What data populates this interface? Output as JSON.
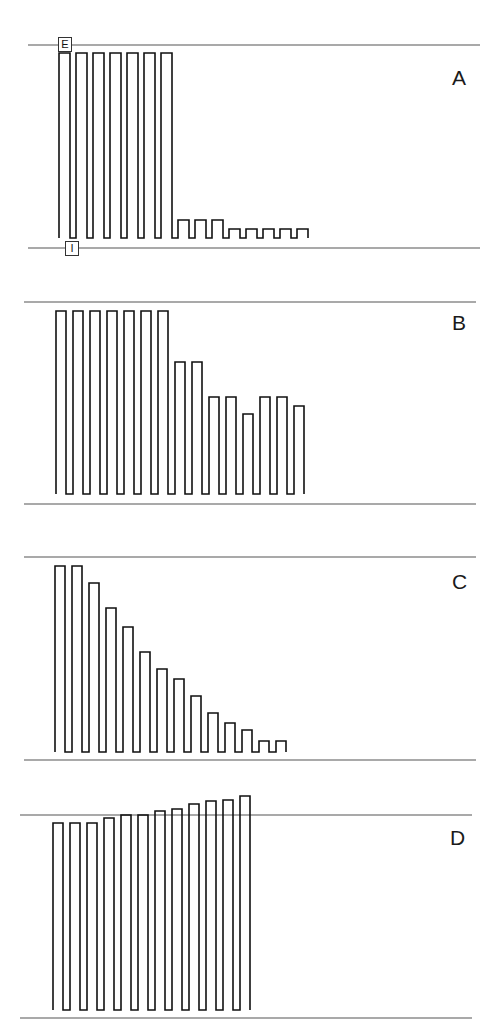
{
  "figure": {
    "panels": [
      {
        "id": "A",
        "label": "A",
        "label_pos": [
          452,
          66
        ],
        "top_line_y": 45,
        "bottom_line_y": 248,
        "line_x": [
          28,
          480
        ],
        "baseline_y": 238,
        "start_x": 59,
        "pulse_width": 11,
        "gap": 6,
        "pulse_tops": [
          53,
          53,
          53,
          53,
          53,
          53,
          53,
          220,
          220,
          220,
          229,
          229,
          229,
          229,
          229
        ],
        "markers": [
          {
            "text": "E",
            "x": 58,
            "y": 37
          },
          {
            "text": "I",
            "x": 65,
            "y": 241
          }
        ]
      },
      {
        "id": "B",
        "label": "B",
        "label_pos": [
          452,
          311
        ],
        "top_line_y": 302,
        "bottom_line_y": 504,
        "line_x": [
          24,
          476
        ],
        "baseline_y": 494,
        "start_x": 56,
        "pulse_width": 10,
        "gap": 7,
        "pulse_tops": [
          311,
          311,
          311,
          311,
          311,
          311,
          311,
          362,
          362,
          397,
          397,
          414,
          397,
          397,
          406
        ],
        "markers": []
      },
      {
        "id": "C",
        "label": "C",
        "label_pos": [
          452,
          570
        ],
        "top_line_y": 557,
        "bottom_line_y": 760,
        "line_x": [
          24,
          476
        ],
        "baseline_y": 752,
        "start_x": 55,
        "pulse_width": 10,
        "gap": 7,
        "pulse_tops": [
          566,
          566,
          583,
          608,
          627,
          652,
          669,
          679,
          696,
          713,
          723,
          730,
          741,
          741
        ],
        "markers": []
      },
      {
        "id": "D",
        "label": "D",
        "label_pos": [
          450,
          826
        ],
        "top_line_y": 815,
        "bottom_line_y": 1018,
        "line_x": [
          20,
          472
        ],
        "baseline_y": 1010,
        "start_x": 53,
        "pulse_width": 10,
        "gap": 7,
        "pulse_tops": [
          823,
          823,
          823,
          818,
          815,
          815,
          811,
          809,
          804,
          801,
          800,
          796
        ],
        "markers": []
      }
    ]
  }
}
